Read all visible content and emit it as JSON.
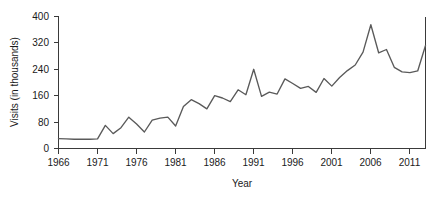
{
  "chart_data": {
    "type": "line",
    "title": "",
    "xlabel": "Year",
    "ylabel": "Visits (in thousands)",
    "xlim": [
      1966,
      2013
    ],
    "ylim": [
      0,
      400
    ],
    "xticks": [
      1966,
      1971,
      1976,
      1981,
      1986,
      1991,
      1996,
      2001,
      2006,
      2011
    ],
    "yticks": [
      0,
      80,
      160,
      240,
      320,
      400
    ],
    "grid": false,
    "legend": null,
    "line_color": "#5a5a5a",
    "axis_color": "#3a3a3a",
    "x": [
      1966,
      1967,
      1968,
      1969,
      1970,
      1971,
      1972,
      1973,
      1974,
      1975,
      1976,
      1977,
      1978,
      1979,
      1980,
      1981,
      1982,
      1983,
      1984,
      1985,
      1986,
      1987,
      1988,
      1989,
      1990,
      1991,
      1992,
      1993,
      1994,
      1995,
      1996,
      1997,
      1998,
      1999,
      2000,
      2001,
      2002,
      2003,
      2004,
      2005,
      2006,
      2007,
      2008,
      2009,
      2010,
      2011,
      2012,
      2013
    ],
    "values": [
      30,
      29,
      28,
      28,
      28,
      29,
      70,
      45,
      63,
      95,
      74,
      50,
      86,
      92,
      95,
      68,
      127,
      148,
      136,
      120,
      160,
      153,
      142,
      178,
      163,
      240,
      158,
      171,
      165,
      211,
      197,
      182,
      188,
      170,
      212,
      189,
      215,
      236,
      253,
      292,
      375,
      290,
      300,
      246,
      232,
      230,
      235,
      312
    ],
    "series": [
      {
        "name": "Visits",
        "values": [
          30,
          29,
          28,
          28,
          28,
          29,
          70,
          45,
          63,
          95,
          74,
          50,
          86,
          92,
          95,
          68,
          127,
          148,
          136,
          120,
          160,
          153,
          142,
          178,
          163,
          240,
          158,
          171,
          165,
          211,
          197,
          182,
          188,
          170,
          212,
          189,
          215,
          236,
          253,
          292,
          375,
          290,
          300,
          246,
          232,
          230,
          235,
          312
        ]
      }
    ]
  },
  "ylabels": {
    "t0": "0",
    "t1": "80",
    "t2": "160",
    "t3": "240",
    "t4": "320",
    "t5": "400"
  },
  "xlabels": {
    "t0": "1966",
    "t1": "1971",
    "t2": "1976",
    "t3": "1981",
    "t4": "1986",
    "t5": "1991",
    "t6": "1996",
    "t7": "2001",
    "t8": "2006",
    "t9": "2011"
  },
  "titles": {
    "x_axis": "Year",
    "y_axis": "Visits (in thousands)"
  }
}
